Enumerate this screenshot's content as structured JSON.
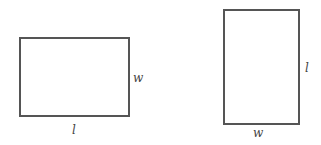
{
  "figures": [
    {
      "name": "landscape-rectangle",
      "side_label": "w",
      "bottom_label": "l"
    },
    {
      "name": "portrait-rectangle",
      "side_label": "l",
      "bottom_label": "w"
    }
  ],
  "colors": {
    "stroke": "#555555",
    "label": "#444444",
    "background": "#ffffff"
  }
}
